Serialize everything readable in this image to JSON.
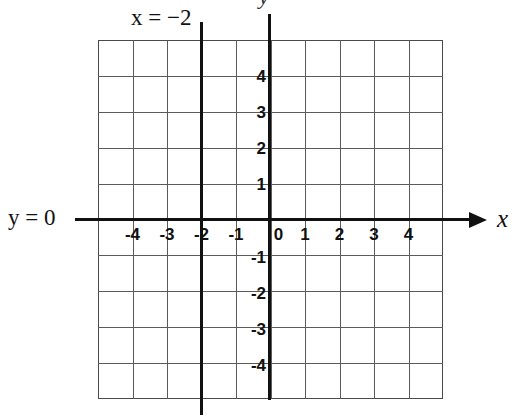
{
  "figure": {
    "title_label": "x = −2",
    "axis_label_x": "x",
    "axis_label_y": "y",
    "y_zero_label": "y = 0",
    "colors": {
      "line": "#111111",
      "grid": "#5b5b5b",
      "background": "#ffffff"
    }
  },
  "chart_data": {
    "type": "line",
    "title": "",
    "xlabel": "x",
    "ylabel": "y",
    "xlim": [
      -5,
      5
    ],
    "ylim": [
      -5,
      5
    ],
    "grid": true,
    "legend": null,
    "x_ticks": [
      -4,
      -3,
      -2,
      -1,
      0,
      1,
      2,
      3,
      4
    ],
    "x_tick_labels": [
      "-4",
      "-3",
      "-2",
      "-1",
      "0",
      "1",
      "2",
      "3",
      "4"
    ],
    "y_ticks": [
      4,
      3,
      2,
      1,
      -1,
      -2,
      -3,
      -4
    ],
    "y_tick_labels": [
      "4",
      "3",
      "2",
      "1",
      "-1",
      "-2",
      "-3",
      "-4"
    ],
    "series": [
      {
        "name": "x = −2",
        "kind": "vertical-line",
        "equation": "x = -2",
        "x_value": -2,
        "annotation": "x = −2",
        "emphasis": "bold"
      },
      {
        "name": "y = 0",
        "kind": "horizontal-line",
        "equation": "y = 0",
        "y_value": 0,
        "annotation": "y = 0",
        "emphasis": "bold"
      }
    ]
  }
}
